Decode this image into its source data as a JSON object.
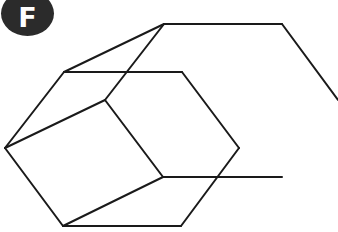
{
  "badge": {
    "label": "F",
    "color": "#2b2b2b",
    "text_color": "#ffffff"
  },
  "figure": {
    "stroke_color": "#1a1a1a",
    "stroke_width": 2,
    "segments": [
      [
        [
          164,
          24
        ],
        [
          282,
          24
        ]
      ],
      [
        [
          282,
          24
        ],
        [
          338,
          100
        ]
      ],
      [
        [
          164,
          24
        ],
        [
          64,
          72
        ]
      ],
      [
        [
          164,
          24
        ],
        [
          105,
          100
        ]
      ],
      [
        [
          64,
          72
        ],
        [
          182,
          72
        ]
      ],
      [
        [
          182,
          72
        ],
        [
          239,
          148
        ]
      ],
      [
        [
          239,
          148
        ],
        [
          181,
          226
        ]
      ],
      [
        [
          181,
          226
        ],
        [
          63,
          226
        ]
      ],
      [
        [
          63,
          226
        ],
        [
          5,
          148
        ]
      ],
      [
        [
          5,
          148
        ],
        [
          64,
          72
        ]
      ],
      [
        [
          5,
          148
        ],
        [
          105,
          100
        ]
      ],
      [
        [
          105,
          100
        ],
        [
          163,
          177
        ]
      ],
      [
        [
          163,
          177
        ],
        [
          282,
          177
        ]
      ],
      [
        [
          163,
          177
        ],
        [
          63,
          226
        ]
      ]
    ]
  }
}
